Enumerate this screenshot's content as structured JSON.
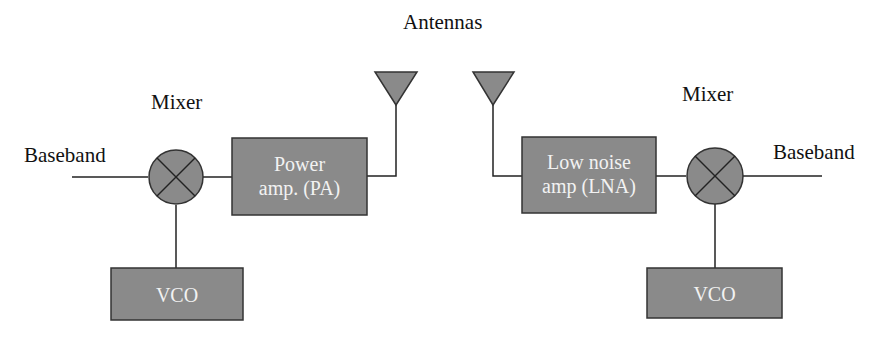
{
  "title": "Antennas",
  "transmitter": {
    "baseband_label": "Baseband",
    "mixer_label": "Mixer",
    "amp_line1": "Power",
    "amp_line2": "amp. (PA)",
    "vco_label": "VCO"
  },
  "receiver": {
    "baseband_label": "Baseband",
    "mixer_label": "Mixer",
    "amp_line1": "Low noise",
    "amp_line2": "amp (LNA)",
    "vco_label": "VCO"
  },
  "colors": {
    "block_fill": "#8a8a8a",
    "block_stroke": "#333333",
    "line": "#222222",
    "text": "#111111",
    "block_text": "#f2f2f2"
  }
}
